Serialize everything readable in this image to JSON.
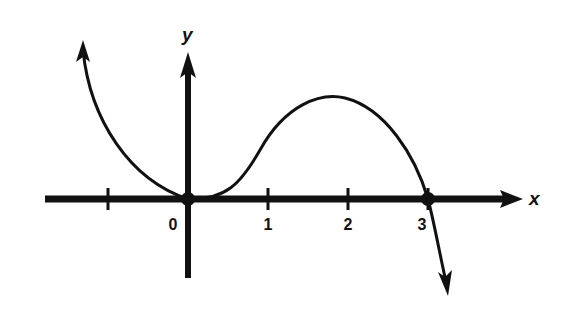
{
  "chart_data": {
    "type": "line",
    "title": "",
    "xlabel": "x",
    "ylabel": "y",
    "function": "y = 3x^2 - x^3 (sketch: touches x-axis at 0, crosses at 3)",
    "x_ticks": [
      -1,
      0,
      1,
      2,
      3
    ],
    "x_tick_labels": [
      "",
      "0",
      "1",
      "2",
      "3"
    ],
    "xlim": [
      -1.8,
      4.2
    ],
    "ylim": [
      -3.4,
      6
    ],
    "series": [
      {
        "name": "curve",
        "x": [
          -1.35,
          -1.2,
          -1.0,
          -0.8,
          -0.6,
          -0.4,
          -0.2,
          0,
          0.2,
          0.4,
          0.6,
          0.8,
          1.0,
          1.2,
          1.4,
          1.6,
          1.8,
          2.0,
          2.2,
          2.4,
          2.6,
          2.8,
          3.0,
          3.2,
          3.4,
          3.55
        ],
        "y": [
          7.93,
          6.05,
          4.0,
          2.43,
          1.3,
          0.54,
          0.13,
          0,
          0.11,
          0.42,
          0.86,
          1.41,
          2.0,
          2.59,
          3.14,
          3.58,
          3.89,
          4.0,
          3.87,
          3.46,
          2.7,
          1.57,
          0,
          -2.05,
          -4.62,
          -6.92
        ]
      }
    ],
    "marked_points": [
      {
        "x": 0,
        "y": 0
      },
      {
        "x": 3,
        "y": 0
      }
    ],
    "grid": false,
    "legend": "none"
  }
}
